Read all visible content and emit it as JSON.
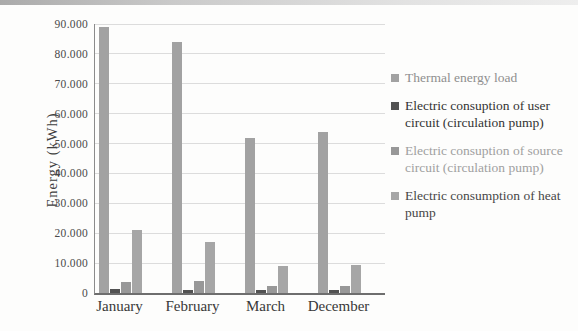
{
  "chart_data": {
    "type": "bar",
    "categories": [
      "January",
      "February",
      "March",
      "December"
    ],
    "series": [
      {
        "name": "Thermal energy load",
        "values": [
          89000,
          84000,
          52000,
          54000
        ],
        "color": "#a2a2a2",
        "legend_text_color": "#8f8f8f"
      },
      {
        "name": "Electric consuption of user circuit (circulation pump)",
        "values": [
          1400,
          1000,
          900,
          900
        ],
        "color": "#525252",
        "legend_text_color": "#333333"
      },
      {
        "name": "Electric consuption of source circuit (circulation pump)",
        "values": [
          3600,
          4000,
          2200,
          2200
        ],
        "color": "#989898",
        "legend_text_color": "#a0a0a0"
      },
      {
        "name": "Electric consumption of heat pump",
        "values": [
          21000,
          17000,
          9000,
          9300
        ],
        "color": "#a6a6a6",
        "legend_text_color": "#474747"
      }
    ],
    "title": "",
    "xlabel": "",
    "ylabel": "Energy (kWh)",
    "ylim": [
      0,
      90000
    ],
    "ytick_step": 10000,
    "ytick_labels": [
      "0",
      "10.000",
      "20.000",
      "30.000",
      "40.000",
      "50.000",
      "60.000",
      "70.000",
      "80.000",
      "90.000"
    ],
    "grid": true,
    "legend_position": "right"
  }
}
